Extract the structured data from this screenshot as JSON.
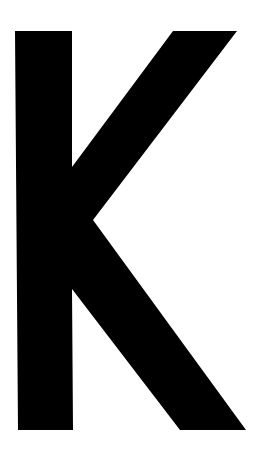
{
  "glyph": {
    "character": "K",
    "fill_color": "#000000",
    "background_color": "#ffffff"
  }
}
